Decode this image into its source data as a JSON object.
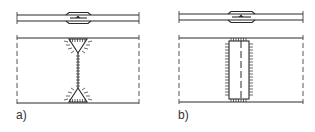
{
  "figure": {
    "panels": [
      {
        "id": "a",
        "label": "a)",
        "description": "Plan and section of welded joint with two triangular fillet weld ends connected by a line weld"
      },
      {
        "id": "b",
        "label": "b)",
        "description": "Plan and section of welded joint with rectangular slot weld and dashed centerline"
      }
    ],
    "colors": {
      "line": "#2a2a2a",
      "background": "#ffffff"
    }
  }
}
